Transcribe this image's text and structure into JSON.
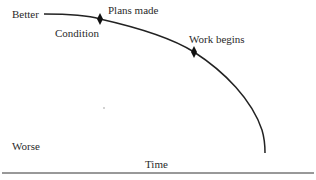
{
  "diagram": {
    "type": "condition-over-time curve",
    "y_axis": {
      "top_label": "Better",
      "bottom_label": "Worse"
    },
    "x_axis": {
      "label": "Time"
    },
    "curve_label": "Condition",
    "markers": [
      {
        "label": "Plans made",
        "shape": "diamond"
      },
      {
        "label": "Work begins",
        "shape": "diamond"
      }
    ]
  },
  "colors": {
    "line": "#222222",
    "text": "#2a2a2a",
    "background": "#ffffff"
  }
}
